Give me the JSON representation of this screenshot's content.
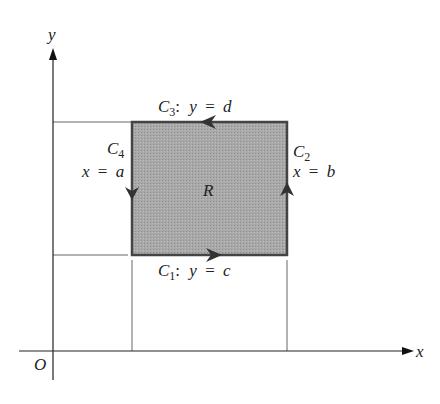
{
  "diagram": {
    "type": "region-boundary-diagram",
    "axes": {
      "x_label": "x",
      "y_label": "y",
      "origin_label": "O"
    },
    "region": {
      "label": "R",
      "fill": "#a6a6a6",
      "stroke": "#444444"
    },
    "curves": [
      {
        "id": "C1",
        "name": "C",
        "sub": "1",
        "eq_lhs": "y",
        "eq_rhs": "c",
        "direction": "right"
      },
      {
        "id": "C2",
        "name": "C",
        "sub": "2",
        "eq_lhs": "x",
        "eq_rhs": "b",
        "direction": "up"
      },
      {
        "id": "C3",
        "name": "C",
        "sub": "3",
        "eq_lhs": "y",
        "eq_rhs": "d",
        "direction": "left"
      },
      {
        "id": "C4",
        "name": "C",
        "sub": "4",
        "eq_lhs": "x",
        "eq_rhs": "a",
        "direction": "down"
      }
    ],
    "equals": "=",
    "colon": ":"
  }
}
